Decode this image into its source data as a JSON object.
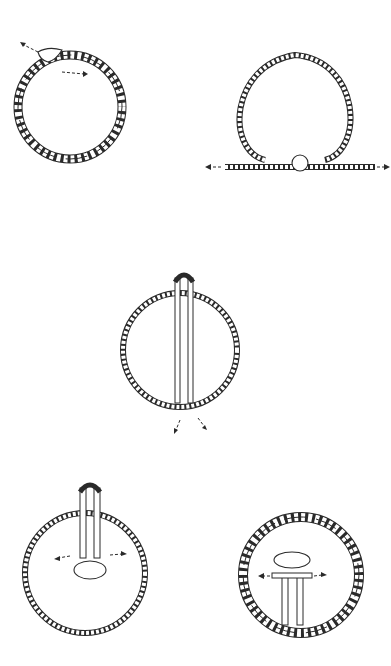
{
  "diagram": {
    "type": "knot-illustration-sequence",
    "background": "#ffffff",
    "line_color": "#2a2a2a",
    "figures": [
      {
        "id": "fig1",
        "description": "twisted double-strand rope ring with overhand knot at top-left, two pull arrows",
        "cx": 70,
        "cy": 107,
        "r": 52,
        "style": "twisted",
        "arrows": [
          "up-left",
          "right"
        ]
      },
      {
        "id": "fig2",
        "description": "single rope loop with knot at bottom, ends pulled left and right",
        "cx": 297,
        "cy": 103,
        "r": 60,
        "style": "single",
        "arrows": [
          "left",
          "right"
        ]
      },
      {
        "id": "fig3",
        "description": "rope ring with two parallel strands running vertically through center, bight at top, ends out bottom",
        "cx": 180,
        "cy": 350,
        "r": 57,
        "style": "single",
        "arrows": [
          "down-left",
          "down-right"
        ]
      },
      {
        "id": "fig4",
        "description": "rope ring with vertical bight at top and knot forming in middle, pulled left and right",
        "cx": 85,
        "cy": 573,
        "r": 60,
        "style": "single",
        "arrows": [
          "left",
          "right"
        ]
      },
      {
        "id": "fig5",
        "description": "twisted rope ring with vertical bight and knot inside, pulled left and right",
        "cx": 301,
        "cy": 575,
        "r": 58,
        "style": "twisted",
        "arrows": [
          "left",
          "right"
        ]
      }
    ]
  }
}
